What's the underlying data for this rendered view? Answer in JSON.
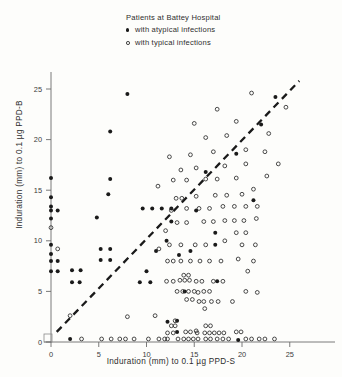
{
  "legend": {
    "title": "Patients at Battey Hospital",
    "entries": [
      {
        "marker": "filled-dot-icon",
        "label": "with atypical infections"
      },
      {
        "marker": "open-circle-icon",
        "label": "with typical infections"
      }
    ]
  },
  "axes": {
    "xlabel": "Induration (mm) to 0.1 µg PPD-S",
    "ylabel": "Induration (mm) to 0.1 µg PPD-B",
    "xticks": [
      "0",
      "5",
      "10",
      "15",
      "20",
      "25"
    ],
    "yticks": [
      "0",
      "5",
      "10",
      "15",
      "20",
      "25"
    ]
  },
  "colors": {
    "ink": "#1a1a1a",
    "axis": "#6b6b6b",
    "background": "#fdfdfb"
  },
  "chart_data": {
    "type": "scatter",
    "title": "Patients at Battey Hospital",
    "xlabel": "Induration (mm) to 0.1 µg PPD-S",
    "ylabel": "Induration (mm) to 0.1 µg PPD-B",
    "xlim": [
      -0.8,
      29
    ],
    "ylim": [
      -0.8,
      28
    ],
    "xticks": [
      0,
      5,
      10,
      15,
      20,
      25
    ],
    "yticks": [
      0,
      5,
      10,
      15,
      20,
      25
    ],
    "grid": false,
    "legend_position": "top-center",
    "reference_line": {
      "style": "dashed",
      "label": "identity line",
      "x": [
        0.6,
        26.0
      ],
      "y": [
        1.0,
        25.8
      ]
    },
    "series": [
      {
        "name": "with atypical infections",
        "marker": "filled-circle",
        "color": "#1a1a1a",
        "points": [
          [
            0,
            7
          ],
          [
            0.7,
            7
          ],
          [
            0,
            8
          ],
          [
            0.7,
            8
          ],
          [
            0,
            8.7
          ],
          [
            0,
            9.6
          ],
          [
            0,
            12.2
          ],
          [
            0,
            13.0
          ],
          [
            0.7,
            13.0
          ],
          [
            0,
            13.4
          ],
          [
            0,
            14.3
          ],
          [
            0,
            16.2
          ],
          [
            2.0,
            0.3
          ],
          [
            2.2,
            5.9
          ],
          [
            3.0,
            5.9
          ],
          [
            2.2,
            7.1
          ],
          [
            3.1,
            7.1
          ],
          [
            5.2,
            8.1
          ],
          [
            6.2,
            8.1
          ],
          [
            5.2,
            9.2
          ],
          [
            6.2,
            9.2
          ],
          [
            4.8,
            12.3
          ],
          [
            6.0,
            14.6
          ],
          [
            8.0,
            24.5
          ],
          [
            6.2,
            16.1
          ],
          [
            6.2,
            20.8
          ],
          [
            9.3,
            5.9
          ],
          [
            10.4,
            5.9
          ],
          [
            10.0,
            7.0
          ],
          [
            11.0,
            9.0
          ],
          [
            9.6,
            13.2
          ],
          [
            10.6,
            13.2
          ],
          [
            11.6,
            13.2
          ],
          [
            12.6,
            13.2
          ],
          [
            12.6,
            11.9
          ],
          [
            12.1,
            10.0
          ],
          [
            13.2,
            1.0
          ],
          [
            12.2,
            2.0
          ],
          [
            13.2,
            2.1
          ],
          [
            13.4,
            8.6
          ],
          [
            14.6,
            9.0
          ],
          [
            14.0,
            5.0
          ],
          [
            15.2,
            13.0
          ],
          [
            16.2,
            16.8
          ],
          [
            17.2,
            9.6
          ],
          [
            17.2,
            10.8
          ],
          [
            17.4,
            6.0
          ],
          [
            19.6,
            0.2
          ],
          [
            19.4,
            18.6
          ],
          [
            21.2,
            14.0
          ],
          [
            22.0,
            21.5
          ],
          [
            23.5,
            24.2
          ]
        ]
      },
      {
        "name": "with typical infections",
        "marker": "open-circle",
        "color": "#2a2a2a",
        "points": [
          [
            0,
            11.3
          ],
          [
            0.7,
            9.2
          ],
          [
            2.0,
            2.6
          ],
          [
            3.2,
            0.3
          ],
          [
            5.3,
            0.3
          ],
          [
            6.3,
            0.3
          ],
          [
            7.2,
            0.3
          ],
          [
            7.8,
            0.3
          ],
          [
            8.7,
            0.3
          ],
          [
            8.0,
            2.5
          ],
          [
            10.2,
            0.3
          ],
          [
            10.9,
            2.6
          ],
          [
            11.3,
            0.3
          ],
          [
            11.9,
            0.3
          ],
          [
            12.2,
            0.9
          ],
          [
            12.8,
            0.9
          ],
          [
            12.6,
            1.6
          ],
          [
            13.0,
            1.6
          ],
          [
            13.0,
            2.1
          ],
          [
            12.2,
            0.3
          ],
          [
            13.3,
            0.3
          ],
          [
            13.9,
            0.3
          ],
          [
            14.4,
            0.3
          ],
          [
            14.9,
            0.3
          ],
          [
            15.4,
            0.3
          ],
          [
            14.1,
            1.0
          ],
          [
            14.6,
            1.0
          ],
          [
            15.2,
            1.1
          ],
          [
            15.3,
            0.9
          ],
          [
            16.2,
            0.3
          ],
          [
            16.7,
            0.3
          ],
          [
            16.1,
            0.9
          ],
          [
            16.6,
            0.9
          ],
          [
            17.1,
            0.9
          ],
          [
            16.2,
            1.6
          ],
          [
            16.7,
            1.6
          ],
          [
            17.4,
            0.3
          ],
          [
            18.0,
            0.3
          ],
          [
            17.6,
            0.9
          ],
          [
            18.1,
            0.9
          ],
          [
            18.6,
            0.3
          ],
          [
            19.4,
            1.0
          ],
          [
            19.9,
            1.0
          ],
          [
            20.4,
            0.3
          ],
          [
            21.0,
            0.3
          ],
          [
            21.8,
            0.3
          ],
          [
            22.4,
            0.3
          ],
          [
            23.4,
            0.3
          ],
          [
            15.5,
            4.0
          ],
          [
            16.0,
            4.0
          ],
          [
            16.1,
            3.3
          ],
          [
            14.2,
            4.2
          ],
          [
            14.8,
            4.2
          ],
          [
            15.4,
            4.9
          ],
          [
            16.8,
            4.0
          ],
          [
            17.5,
            4.0
          ],
          [
            13.2,
            5.0
          ],
          [
            13.8,
            5.0
          ],
          [
            14.4,
            5.0
          ],
          [
            15.0,
            5.0
          ],
          [
            16.0,
            5.0
          ],
          [
            16.6,
            5.0
          ],
          [
            12.1,
            6.0
          ],
          [
            12.8,
            6.0
          ],
          [
            13.5,
            6.1
          ],
          [
            14.0,
            6.1
          ],
          [
            14.5,
            6.1
          ],
          [
            15.2,
            6.0
          ],
          [
            15.8,
            6.0
          ],
          [
            13.9,
            6.6
          ],
          [
            14.4,
            6.6
          ],
          [
            17.0,
            6.0
          ],
          [
            18.0,
            6.0
          ],
          [
            19.0,
            4.0
          ],
          [
            20.4,
            5.0
          ],
          [
            21.6,
            4.9
          ],
          [
            12.2,
            8.0
          ],
          [
            12.8,
            8.0
          ],
          [
            13.6,
            8.0
          ],
          [
            14.6,
            8.0
          ],
          [
            15.6,
            8.0
          ],
          [
            16.6,
            8.0
          ],
          [
            17.8,
            8.0
          ],
          [
            19.6,
            8.2
          ],
          [
            21.2,
            8.0
          ],
          [
            11.3,
            9.2
          ],
          [
            12.4,
            9.6
          ],
          [
            13.6,
            9.6
          ],
          [
            15.1,
            9.6
          ],
          [
            16.2,
            9.6
          ],
          [
            18.2,
            10.0
          ],
          [
            19.4,
            10.8
          ],
          [
            20.4,
            10.8
          ],
          [
            20.0,
            9.6
          ],
          [
            21.4,
            9.6
          ],
          [
            12.0,
            11.0
          ],
          [
            13.2,
            11.8
          ],
          [
            14.2,
            11.8
          ],
          [
            16.0,
            11.9
          ],
          [
            17.0,
            11.9
          ],
          [
            18.2,
            12.0
          ],
          [
            19.2,
            12.0
          ],
          [
            20.2,
            12.0
          ],
          [
            21.5,
            12.2
          ],
          [
            12.6,
            13.0
          ],
          [
            14.2,
            13.2
          ],
          [
            15.5,
            13.2
          ],
          [
            16.6,
            13.2
          ],
          [
            18.0,
            13.4
          ],
          [
            19.2,
            13.4
          ],
          [
            20.4,
            13.4
          ],
          [
            21.6,
            13.4
          ],
          [
            13.1,
            14.2
          ],
          [
            13.7,
            14.2
          ],
          [
            15.2,
            14.4
          ],
          [
            17.2,
            14.5
          ],
          [
            18.4,
            14.5
          ],
          [
            20.0,
            14.6
          ],
          [
            21.2,
            15.1
          ],
          [
            11.2,
            15.4
          ],
          [
            12.8,
            16.0
          ],
          [
            14.2,
            16.0
          ],
          [
            16.2,
            16.1
          ],
          [
            17.4,
            16.1
          ],
          [
            19.4,
            16.2
          ],
          [
            22.6,
            16.4
          ],
          [
            13.6,
            17.0
          ],
          [
            15.2,
            17.2
          ],
          [
            18.2,
            17.4
          ],
          [
            20.4,
            17.6
          ],
          [
            23.8,
            17.6
          ],
          [
            12.4,
            18.3
          ],
          [
            14.6,
            18.5
          ],
          [
            17.0,
            18.8
          ],
          [
            20.4,
            19.0
          ],
          [
            22.4,
            18.8
          ],
          [
            16.2,
            20.2
          ],
          [
            18.4,
            20.4
          ],
          [
            22.8,
            20.6
          ],
          [
            15.0,
            21.6
          ],
          [
            19.4,
            21.8
          ],
          [
            17.4,
            23.0
          ],
          [
            21.0,
            24.6
          ],
          [
            24.6,
            23.2
          ],
          [
            20.6,
            7.0
          ]
        ]
      }
    ]
  }
}
